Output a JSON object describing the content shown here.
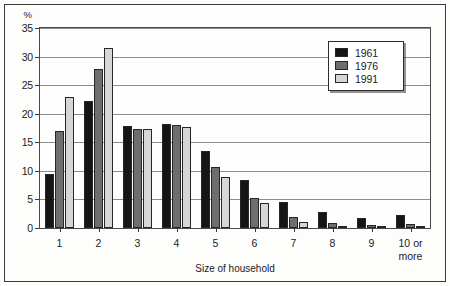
{
  "chart_data": {
    "type": "bar",
    "title": "",
    "xlabel": "Size of household",
    "ylabel": "%",
    "categories": [
      "1",
      "2",
      "3",
      "4",
      "5",
      "6",
      "7",
      "8",
      "9",
      "10 or\nmore"
    ],
    "series": [
      {
        "name": "1961",
        "color": "#151515",
        "values": [
          9.4,
          22.2,
          17.8,
          18.2,
          13.4,
          8.4,
          4.6,
          2.8,
          1.7,
          2.3
        ]
      },
      {
        "name": "1976",
        "color": "#6e6e6e",
        "values": [
          17.0,
          27.9,
          17.4,
          18.1,
          10.6,
          5.3,
          2.0,
          0.9,
          0.5,
          0.7
        ]
      },
      {
        "name": "1991",
        "color": "#d6d6d6",
        "values": [
          22.9,
          31.5,
          17.3,
          17.7,
          9.0,
          4.4,
          1.1,
          0.4,
          0.2,
          0.3
        ]
      }
    ],
    "ylim": [
      0,
      35
    ],
    "yticks": [
      0,
      5,
      10,
      15,
      20,
      25,
      30,
      35
    ],
    "grid": true,
    "legend_position": "top-right"
  },
  "legend": {
    "items": [
      {
        "label": "1961"
      },
      {
        "label": "1976"
      },
      {
        "label": "1991"
      }
    ]
  },
  "axes": {
    "y_unit": "%",
    "x_title": "Size of household"
  }
}
